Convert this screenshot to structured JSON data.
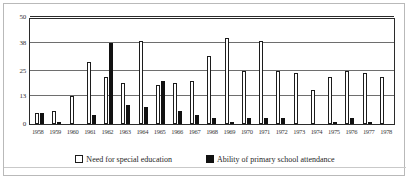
{
  "chart_data": {
    "type": "bar",
    "title": "",
    "subtitle": "",
    "xlabel": "",
    "ylabel": "",
    "grid": true,
    "legend_position": "bottom",
    "ylim": [
      0,
      50
    ],
    "yticks": [
      0,
      13,
      25,
      38,
      50
    ],
    "ytick_labels": [
      "0",
      "13",
      "25",
      "38",
      "50"
    ],
    "categories": [
      "1958",
      "1959",
      "1960",
      "1961",
      "1962",
      "1963",
      "1964",
      "1965",
      "1966",
      "1967",
      "1968",
      "1969",
      "1970",
      "1971",
      "1972",
      "1973",
      "1974",
      "1975",
      "1976",
      "1977",
      "1978"
    ],
    "series": [
      {
        "name": "Need for special education",
        "style": "open",
        "color": "#ffffff",
        "edge_color": "#1c1c1c",
        "values": [
          5,
          6,
          13,
          29,
          22,
          19,
          39,
          18,
          19,
          20,
          32,
          40,
          25,
          39,
          25,
          24,
          16,
          22,
          25,
          24,
          22
        ]
      },
      {
        "name": "Ability of primary school attendance",
        "style": "solid",
        "color": "#111111",
        "edge_color": "#111111",
        "values": [
          5,
          1,
          0,
          4,
          38,
          9,
          8,
          20,
          6,
          4,
          3,
          1,
          3,
          3,
          3,
          0,
          0,
          1,
          3,
          1,
          0
        ]
      }
    ]
  },
  "legend": {
    "items": [
      {
        "label": "Need for special education",
        "marker": "open-square-marker"
      },
      {
        "label": "Ability of primary school attendance",
        "marker": "filled-square-marker"
      }
    ]
  }
}
